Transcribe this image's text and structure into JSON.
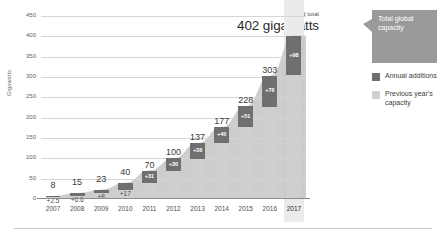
{
  "chart_data": {
    "type": "bar",
    "title": "",
    "subtitle": "",
    "xlabel": "",
    "ylabel": "Gigawatts",
    "ylim": [
      0,
      450
    ],
    "yticks": [
      0,
      50,
      100,
      150,
      200,
      250,
      300,
      350,
      400,
      450
    ],
    "ytick_labels": [
      "0",
      "50",
      "100",
      "150",
      "200",
      "250",
      "300",
      "350",
      "400",
      "450"
    ],
    "grid": true,
    "legend_position": "right",
    "categories": [
      "2007",
      "2008",
      "2009",
      "2010",
      "2011",
      "2012",
      "2013",
      "2014",
      "2015",
      "2016",
      "2017"
    ],
    "highlight_category": "2017",
    "series": [
      {
        "name": "Previous year's capacity",
        "values": [
          5.5,
          8.4,
          15.0,
          23.0,
          39.0,
          70.0,
          99.0,
          137.0,
          177.0,
          227.0,
          304.0
        ]
      },
      {
        "name": "Annual additions",
        "values": [
          2.5,
          6.6,
          8.0,
          17.0,
          31.0,
          30.0,
          38.0,
          40.0,
          51.0,
          76.0,
          98.0
        ]
      }
    ],
    "totals": [
      8,
      15,
      23,
      40,
      70,
      100,
      137,
      177,
      228,
      303,
      402
    ],
    "total_labels": [
      "8",
      "15",
      "23",
      "40",
      "70",
      "100",
      "137",
      "177",
      "228",
      "303",
      ""
    ],
    "addition_labels": [
      "+2.5",
      "+6.6",
      "+8",
      "+17",
      "+31",
      "+30",
      "+38",
      "+40",
      "+51",
      "+76",
      "+98"
    ],
    "annotations": [
      {
        "text": "World total",
        "value": "402 gigawatts",
        "target": "2017"
      }
    ]
  },
  "annotation": {
    "world_total_label": "World total",
    "world_total_value": "402 gigawatts"
  },
  "axis": {
    "ylabel": "Gigawatts"
  },
  "legend": {
    "callout": "Total global capacity",
    "items": [
      {
        "label": "Annual additions",
        "color": "#6f6f6f"
      },
      {
        "label": "Previous year's capacity",
        "color": "#cfcfcf"
      }
    ]
  },
  "colors": {
    "annual_additions": "#6f6f6f",
    "previous_capacity": "#cfcfcf",
    "callout_bg": "#9a9a9a",
    "area_fill": "#c4c4c4",
    "gridline": "#d5d5d5",
    "highlight_column": "#ebebeb"
  }
}
